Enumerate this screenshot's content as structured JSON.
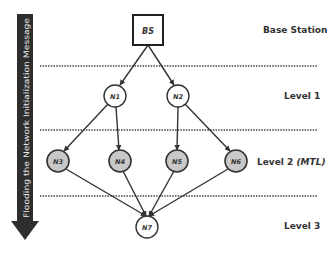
{
  "diagram": {
    "arrow": {
      "label": "Flooding the Network Initialization Message",
      "color": "#2e2e2e"
    },
    "base_station": {
      "label": "BS"
    },
    "levels": [
      {
        "label": "Base Station",
        "y": 31
      },
      {
        "label": "Level 1",
        "y": 97
      },
      {
        "label": "Level 2",
        "suffix": "(MTL)",
        "y": 163
      },
      {
        "label": "Level 3",
        "y": 227
      }
    ],
    "nodes": [
      {
        "id": "N1",
        "level": 1,
        "fill": "#ffffff"
      },
      {
        "id": "N2",
        "level": 1,
        "fill": "#ffffff"
      },
      {
        "id": "N3",
        "level": 2,
        "fill": "#c8c8c8"
      },
      {
        "id": "N4",
        "level": 2,
        "fill": "#c8c8c8"
      },
      {
        "id": "N5",
        "level": 2,
        "fill": "#c8c8c8"
      },
      {
        "id": "N6",
        "level": 2,
        "fill": "#c8c8c8"
      },
      {
        "id": "N7",
        "level": 3,
        "fill": "#ffffff"
      }
    ],
    "edges": [
      [
        "BS",
        "N1"
      ],
      [
        "BS",
        "N2"
      ],
      [
        "N1",
        "N3"
      ],
      [
        "N1",
        "N4"
      ],
      [
        "N2",
        "N5"
      ],
      [
        "N2",
        "N6"
      ],
      [
        "N3",
        "N7"
      ],
      [
        "N4",
        "N7"
      ],
      [
        "N5",
        "N7"
      ],
      [
        "N6",
        "N7"
      ]
    ]
  }
}
